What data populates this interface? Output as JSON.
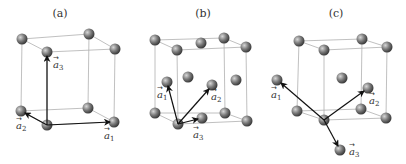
{
  "figure": {
    "panels": [
      {
        "id": "a",
        "label": "(a)",
        "lattice": "simple cubic",
        "vectors": [
          {
            "label": "a",
            "sub": "1"
          },
          {
            "label": "a",
            "sub": "2"
          },
          {
            "label": "a",
            "sub": "3"
          }
        ]
      },
      {
        "id": "b",
        "label": "(b)",
        "lattice": "face-centered cubic",
        "vectors": [
          {
            "label": "a",
            "sub": "1"
          },
          {
            "label": "a",
            "sub": "2"
          },
          {
            "label": "a",
            "sub": "3"
          }
        ]
      },
      {
        "id": "c",
        "label": "(c)",
        "lattice": "body-centered cubic",
        "vectors": [
          {
            "label": "a",
            "sub": "1"
          },
          {
            "label": "a",
            "sub": "2"
          },
          {
            "label": "a",
            "sub": "3"
          }
        ]
      }
    ],
    "colors": {
      "atom": "#6e6e6e",
      "atom_highlight": "#d0d0d0",
      "edge": "#b0b0b0",
      "vector": "#111111"
    }
  }
}
